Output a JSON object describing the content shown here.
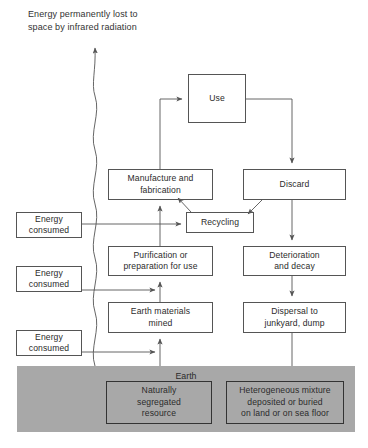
{
  "diagram": {
    "title_note": "Energy permanently lost to\nspace by infrared radiation",
    "earth_label": "Earth",
    "colors": {
      "earth_fill": "#a8a8a8",
      "box_stroke": "#555555",
      "earth_box_stroke": "#333333",
      "line": "#555555",
      "text": "#2b2b2b",
      "background": "#ffffff"
    },
    "nodes": [
      {
        "id": "use",
        "label": "Use",
        "x": 188,
        "y": 74,
        "w": 58,
        "h": 49
      },
      {
        "id": "manufacture",
        "label": "Manufacture and\nfabrication",
        "x": 108,
        "y": 169,
        "w": 105,
        "h": 31
      },
      {
        "id": "discard",
        "label": "Discard",
        "x": 243,
        "y": 169,
        "w": 103,
        "h": 31
      },
      {
        "id": "recycling",
        "label": "Recycling",
        "x": 186,
        "y": 212,
        "w": 68,
        "h": 21
      },
      {
        "id": "purification",
        "label": "Purification or\npreparation for use",
        "x": 108,
        "y": 246,
        "w": 105,
        "h": 30
      },
      {
        "id": "deterioration",
        "label": "Deterioration\nand decay",
        "x": 243,
        "y": 246,
        "w": 103,
        "h": 30
      },
      {
        "id": "earth-materials",
        "label": "Earth materials\nmined",
        "x": 108,
        "y": 302,
        "w": 105,
        "h": 31
      },
      {
        "id": "dispersal",
        "label": "Dispersal to\njunkyard, dump",
        "x": 243,
        "y": 302,
        "w": 103,
        "h": 31
      }
    ],
    "energy_nodes": [
      {
        "id": "energy-consumed-1",
        "label": "Energy\nconsumed",
        "x": 16,
        "y": 212,
        "w": 66,
        "h": 26
      },
      {
        "id": "energy-consumed-2",
        "label": "Energy\nconsumed",
        "x": 16,
        "y": 266,
        "w": 66,
        "h": 26
      },
      {
        "id": "energy-consumed-3",
        "label": "Energy\nconsumed",
        "x": 16,
        "y": 330,
        "w": 66,
        "h": 26
      }
    ],
    "earth_region": {
      "x": 17,
      "y": 366,
      "w": 338,
      "h": 66
    },
    "earth_nodes": [
      {
        "id": "natural-resource",
        "label": "Naturally\nsegregated\nresource",
        "x": 106,
        "y": 381,
        "w": 106,
        "h": 43
      },
      {
        "id": "heterogeneous-mixture",
        "label": "Heterogeneous mixture\ndeposited or buried\non land or on sea floor",
        "x": 226,
        "y": 381,
        "w": 118,
        "h": 43
      }
    ]
  }
}
